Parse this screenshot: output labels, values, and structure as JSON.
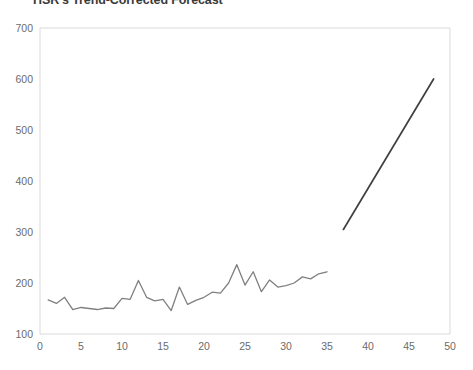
{
  "chart_data": {
    "type": "line",
    "title": "HSR's Trend-Corrected Forecast",
    "xlabel": "",
    "ylabel": "",
    "xlim": [
      0,
      50
    ],
    "ylim": [
      100,
      700
    ],
    "xticks": [
      0,
      5,
      10,
      15,
      20,
      25,
      30,
      35,
      40,
      45,
      50
    ],
    "yticks": [
      100,
      200,
      300,
      400,
      500,
      600,
      700
    ],
    "grid": false,
    "legend": "none",
    "colors": {
      "historical": "#808080",
      "forecast": "#404040",
      "axis": "#d9d9d9",
      "tick_text": "#6b6b6b",
      "title_text": "#3a3a3a",
      "plot_background": "#ffffff"
    },
    "series": [
      {
        "name": "Historical Demand",
        "color": "#808080",
        "x": [
          1,
          2,
          3,
          4,
          5,
          6,
          7,
          8,
          9,
          10,
          11,
          12,
          13,
          14,
          15,
          16,
          17,
          18,
          19,
          20,
          21,
          22,
          23,
          24,
          25,
          26,
          27,
          28,
          29,
          30,
          31,
          32,
          33,
          34,
          35
        ],
        "values": [
          167,
          160,
          172,
          148,
          152,
          150,
          148,
          151,
          150,
          170,
          168,
          205,
          172,
          165,
          168,
          146,
          192,
          158,
          166,
          172,
          182,
          180,
          200,
          236,
          196,
          222,
          183,
          206,
          192,
          195,
          200,
          212,
          208,
          218,
          222
        ]
      },
      {
        "name": "Trend-Corrected Forecast",
        "color": "#404040",
        "x": [
          37,
          48
        ],
        "values": [
          305,
          600
        ]
      }
    ]
  }
}
